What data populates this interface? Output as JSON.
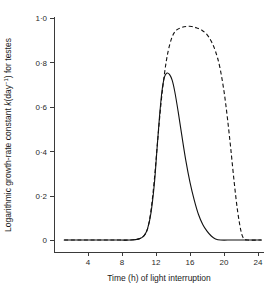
{
  "chart_data": {
    "type": "line",
    "title": "",
    "xlabel": "Time (h) of light interruption",
    "ylabel": "Logarithmic growth-rate constant k(day⁻¹) for testes",
    "ylabel_parts": {
      "lead": "Logarithmic growth-rate constant ",
      "symbol": "k",
      "units_open": "(day",
      "units_exp": "−1",
      "units_close": ") for testes"
    },
    "xlim": [
      0,
      24.6
    ],
    "ylim": [
      -0.03,
      1.0
    ],
    "grid": false,
    "legend": "none",
    "xticks": [
      4,
      8,
      12,
      16,
      20,
      24
    ],
    "xtick_labels": [
      "4",
      "8",
      "12",
      "16",
      "20",
      "24"
    ],
    "yticks": [
      0,
      0.2,
      0.4,
      0.6,
      0.8,
      1.0
    ],
    "ytick_labels": [
      "0",
      "0·2",
      "0·4",
      "0·6",
      "0·8",
      "1·0"
    ],
    "series": [
      {
        "name": "solid-curve",
        "style": "solid",
        "color": "#111111",
        "x": [
          1.2,
          3.0,
          5.0,
          7.0,
          9.0,
          10.0,
          10.6,
          11.0,
          11.4,
          11.8,
          12.1,
          12.4,
          12.7,
          13.0,
          13.3,
          13.6,
          13.9,
          14.2,
          14.6,
          15.0,
          15.5,
          16.0,
          16.5,
          17.0,
          17.5,
          18.0,
          18.5,
          19.0,
          19.6,
          21.0,
          23.0,
          24.4
        ],
        "y": [
          0.0,
          0.0,
          0.0,
          0.0,
          0.0,
          0.005,
          0.02,
          0.05,
          0.12,
          0.25,
          0.4,
          0.55,
          0.67,
          0.735,
          0.752,
          0.745,
          0.72,
          0.67,
          0.58,
          0.48,
          0.36,
          0.26,
          0.18,
          0.115,
          0.07,
          0.04,
          0.018,
          0.005,
          0.0,
          0.0,
          0.0,
          0.0
        ]
      },
      {
        "name": "dashed-curve",
        "style": "dashed",
        "color": "#111111",
        "x": [
          1.2,
          3.0,
          5.0,
          7.0,
          9.0,
          10.0,
          10.6,
          11.0,
          11.4,
          11.8,
          12.2,
          12.6,
          13.0,
          13.4,
          13.9,
          14.4,
          15.0,
          15.6,
          16.2,
          16.8,
          17.4,
          18.0,
          18.5,
          19.0,
          19.5,
          20.0,
          20.4,
          20.8,
          21.2,
          21.6,
          22.0,
          22.3,
          22.8,
          24.4
        ],
        "y": [
          0.0,
          0.0,
          0.0,
          0.0,
          0.0,
          0.005,
          0.02,
          0.05,
          0.13,
          0.27,
          0.45,
          0.62,
          0.75,
          0.845,
          0.915,
          0.945,
          0.957,
          0.962,
          0.962,
          0.955,
          0.945,
          0.925,
          0.895,
          0.85,
          0.78,
          0.67,
          0.55,
          0.41,
          0.26,
          0.13,
          0.04,
          0.008,
          0.0,
          0.0
        ]
      }
    ]
  },
  "geometry": {
    "x0_px": 54,
    "px_per_hour": 8.5,
    "y0_px": 240,
    "px_per_unit": 222
  }
}
